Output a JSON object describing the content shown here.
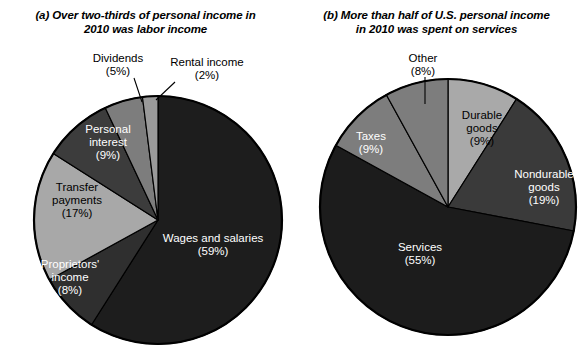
{
  "figure": {
    "panels": [
      {
        "tag": "(a)",
        "title_line1": "Over two-thirds of personal income in",
        "title_line2": "2010 was labor income",
        "chart_ref": 0
      },
      {
        "tag": "(b)",
        "title_line1": "More than half of U.S. personal income",
        "title_line2": "in 2010 was spent on services",
        "chart_ref": 1
      }
    ]
  },
  "chart_data": [
    {
      "type": "pie",
      "title": "(a) Over two-thirds of personal income in 2010 was labor income",
      "start_angle_deg": 0,
      "direction": "clockwise",
      "center": [
        158,
        220
      ],
      "radius": 124,
      "categories": [
        "Wages and salaries",
        "Proprietors' income",
        "Transfer payments",
        "Personal interest",
        "Dividends",
        "Rental income"
      ],
      "values": [
        59,
        17,
        9,
        5,
        2,
        8
      ],
      "slices": [
        {
          "label": "Wages and salaries",
          "value_label": "(59%)",
          "value": 59,
          "color": "#1d1d1d",
          "label_color": "#ffffff",
          "label_pos": [
            213,
            242
          ],
          "label_anchor": "middle",
          "callout": false
        },
        {
          "label": "Proprietors'",
          "label2": "income",
          "value_label": "(8%)",
          "value": 8,
          "color": "#2f2f2f",
          "label_color": "#ffffff",
          "label_pos": [
            70,
            268
          ],
          "label_anchor": "middle",
          "callout": false
        },
        {
          "label": "Transfer",
          "label2": "payments",
          "value_label": "(17%)",
          "value": 17,
          "color": "#a8a8a8",
          "label_color": "#000000",
          "label_pos": [
            77,
            191
          ],
          "label_anchor": "middle",
          "callout": false
        },
        {
          "label": "Personal",
          "label2": "interest",
          "value_label": "(9%)",
          "value": 9,
          "color": "#3c3c3c",
          "label_color": "#ffffff",
          "label_pos": [
            108,
            133
          ],
          "label_anchor": "middle",
          "callout": false
        },
        {
          "label": "Dividends",
          "value_label": "(5%)",
          "value": 5,
          "color": "#7d7d7d",
          "label_color": "#000000",
          "label_pos": [
            118,
            62
          ],
          "label_anchor": "middle",
          "callout": true,
          "leader": [
            134,
            78,
            142,
            102
          ]
        },
        {
          "label": "Rental income",
          "value_label": "(2%)",
          "value": 2,
          "color": "#9a9a9a",
          "label_color": "#000000",
          "label_pos": [
            207,
            66
          ],
          "label_anchor": "middle",
          "callout": true,
          "leader": [
            175,
            82,
            156,
            100
          ]
        }
      ]
    },
    {
      "type": "pie",
      "title": "(b) More than half of U.S. personal income in 2010 was spent on services",
      "start_angle_deg": 0,
      "direction": "clockwise",
      "center": [
        157,
        207
      ],
      "radius": 128,
      "categories": [
        "Durable goods",
        "Nondurable goods",
        "Services",
        "Taxes",
        "Other"
      ],
      "values": [
        9,
        19,
        55,
        9,
        8
      ],
      "slices": [
        {
          "label": "Durable",
          "label2": "goods",
          "value_label": "(9%)",
          "value": 9,
          "color": "#a9a9a9",
          "label_color": "#000000",
          "label_pos": [
            191,
            119
          ],
          "label_anchor": "middle",
          "callout": false
        },
        {
          "label": "Nondurable",
          "label2": "goods",
          "value_label": "(19%)",
          "value": 19,
          "color": "#3a3a3a",
          "label_color": "#ffffff",
          "label_pos": [
            253,
            178
          ],
          "label_anchor": "middle",
          "callout": false
        },
        {
          "label": "Services",
          "value_label": "(55%)",
          "value": 55,
          "color": "#1c1c1c",
          "label_color": "#ffffff",
          "label_pos": [
            129,
            251
          ],
          "label_anchor": "middle",
          "callout": false
        },
        {
          "label": "Taxes",
          "value_label": "(9%)",
          "value": 9,
          "color": "#7d7d7d",
          "label_color": "#ffffff",
          "label_pos": [
            80,
            140
          ],
          "label_anchor": "middle",
          "callout": false
        },
        {
          "label": "Other",
          "value_label": "(8%)",
          "value": 8,
          "color": "#7d7d7d",
          "label_color": "#000000",
          "label_pos": [
            132,
            62
          ],
          "label_anchor": "middle",
          "callout": true,
          "leader": [
            134,
            77,
            134,
            104
          ]
        }
      ]
    }
  ]
}
